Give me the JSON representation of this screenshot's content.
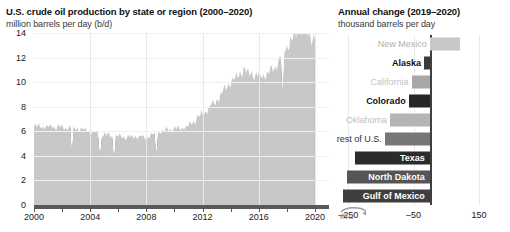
{
  "left": {
    "title": "U.S. crude oil production by state or region (2000–2020)",
    "subtitle": "million barrels per day (b/d)"
  },
  "right": {
    "title": "Annual change (2019–2020)",
    "subtitle": "thousand barrels per day"
  },
  "logo": {
    "text": "eia",
    "name": "eia-logo"
  },
  "chart_data": [
    {
      "type": "area",
      "id": "us-crude-oil-production-stacked-area",
      "title": "U.S. crude oil production by state or region (2000–2020)",
      "subtitle": "million barrels per day (b/d)",
      "xlabel": "",
      "ylabel": "million barrels per day (b/d)",
      "xlim": [
        2000,
        2021
      ],
      "ylim": [
        0,
        14
      ],
      "yticks": [
        0,
        2,
        4,
        6,
        8,
        10,
        12,
        14
      ],
      "xticks": [
        2000,
        2004,
        2008,
        2012,
        2016,
        2020
      ],
      "grid": true,
      "legend": "none",
      "stacked": true,
      "x": [
        2000,
        2001,
        2002,
        2003,
        2004,
        2005,
        2006,
        2007,
        2008,
        2009,
        2010,
        2011,
        2012,
        2013,
        2014,
        2015,
        2016,
        2017,
        2018,
        2019,
        2020
      ],
      "series": [
        {
          "name": "Gulf of Mexico",
          "color": "#808080",
          "values": [
            1.43,
            1.54,
            1.56,
            1.56,
            1.45,
            1.28,
            1.3,
            1.27,
            1.15,
            1.56,
            1.55,
            1.32,
            1.27,
            1.26,
            1.4,
            1.53,
            1.6,
            1.65,
            1.77,
            1.89,
            1.65
          ]
        },
        {
          "name": "Texas",
          "color": "#2b2b2b",
          "values": [
            1.1,
            1.08,
            1.04,
            1.02,
            1.01,
            0.99,
            0.99,
            1.0,
            1.09,
            1.11,
            1.16,
            1.42,
            1.98,
            2.58,
            3.17,
            3.46,
            3.25,
            3.48,
            4.41,
            5.07,
            4.67
          ]
        },
        {
          "name": "North Dakota",
          "color": "#a8a8a8",
          "values": [
            0.09,
            0.09,
            0.08,
            0.08,
            0.08,
            0.1,
            0.11,
            0.12,
            0.17,
            0.22,
            0.31,
            0.42,
            0.66,
            0.86,
            1.09,
            1.17,
            1.03,
            1.05,
            1.26,
            1.43,
            1.18
          ]
        },
        {
          "name": "rest of U.S.",
          "color": "#3a3a3a",
          "values": [
            1.18,
            1.16,
            1.15,
            1.12,
            1.08,
            1.02,
            1.0,
            0.99,
            0.97,
            0.99,
            1.01,
            1.05,
            1.12,
            1.2,
            1.32,
            1.35,
            1.22,
            1.23,
            1.33,
            1.41,
            1.28
          ]
        },
        {
          "name": "Oklahoma",
          "color": "#a8a8a8",
          "values": [
            0.49,
            0.48,
            0.46,
            0.45,
            0.44,
            0.43,
            0.42,
            0.42,
            0.42,
            0.43,
            0.45,
            0.48,
            0.58,
            0.73,
            0.93,
            1.09,
            1.02,
            1.12,
            1.39,
            1.52,
            1.32
          ]
        },
        {
          "name": "Colorado",
          "color": "#262626",
          "values": [
            0.14,
            0.14,
            0.14,
            0.14,
            0.14,
            0.15,
            0.16,
            0.19,
            0.23,
            0.27,
            0.32,
            0.36,
            0.44,
            0.53,
            0.7,
            0.89,
            0.87,
            0.96,
            1.25,
            1.42,
            1.29
          ]
        },
        {
          "name": "California",
          "color": "#9c9c9c",
          "values": [
            0.77,
            0.76,
            0.75,
            0.73,
            0.71,
            0.69,
            0.68,
            0.66,
            0.65,
            0.63,
            0.62,
            0.61,
            0.6,
            0.58,
            0.57,
            0.55,
            0.51,
            0.48,
            0.47,
            0.45,
            0.4
          ]
        },
        {
          "name": "Alaska",
          "color": "#4d4d4d",
          "values": [
            0.97,
            0.96,
            0.98,
            0.97,
            0.91,
            0.86,
            0.74,
            0.72,
            0.68,
            0.65,
            0.6,
            0.56,
            0.53,
            0.51,
            0.49,
            0.48,
            0.49,
            0.48,
            0.47,
            0.46,
            0.44
          ]
        },
        {
          "name": "New Mexico",
          "color": "#c8c8c8",
          "values": [
            0.18,
            0.18,
            0.17,
            0.17,
            0.17,
            0.17,
            0.17,
            0.16,
            0.16,
            0.16,
            0.17,
            0.19,
            0.24,
            0.29,
            0.36,
            0.41,
            0.4,
            0.47,
            0.65,
            0.92,
            1.17
          ]
        }
      ],
      "peak_note": "peak near 12.8 in early 2020",
      "notes": "monthly data; sharp drop mid-2020"
    },
    {
      "type": "bar",
      "id": "annual-change-2019-2020",
      "orientation": "horizontal",
      "title": "Annual change (2019–2020)",
      "subtitle": "thousand barrels per day",
      "xlabel": "thousand barrels per day",
      "xlim": [
        -330,
        190
      ],
      "xticks": [
        -250,
        -50,
        150
      ],
      "xticklabels": [
        "–250",
        "–50",
        "150"
      ],
      "grid": true,
      "zero_line": true,
      "categories": [
        "New Mexico",
        "Alaska",
        "California",
        "Colorado",
        "Oklahoma",
        "rest of U.S.",
        "Texas",
        "North Dakota",
        "Gulf of Mexico"
      ],
      "values": [
        92,
        -18,
        -56,
        -65,
        -122,
        -138,
        -230,
        -253,
        -265
      ],
      "bar_colors": [
        "#c8c8c8",
        "#3a3a3a",
        "#a8a8a8",
        "#262626",
        "#b4b4b4",
        "#777777",
        "#2b2b2b",
        "#555555",
        "#3f3f3f"
      ],
      "label_styles": [
        "muted",
        "bold",
        "muted",
        "bold",
        "muted",
        "normal",
        "inside",
        "inside",
        "inside"
      ],
      "label_colors": [
        "#b0b0b0",
        "#111111",
        "#c2c2c2",
        "#111111",
        "#c2c2c2",
        "#333333",
        "#ffffff",
        "#ffffff",
        "#ffffff"
      ]
    }
  ]
}
